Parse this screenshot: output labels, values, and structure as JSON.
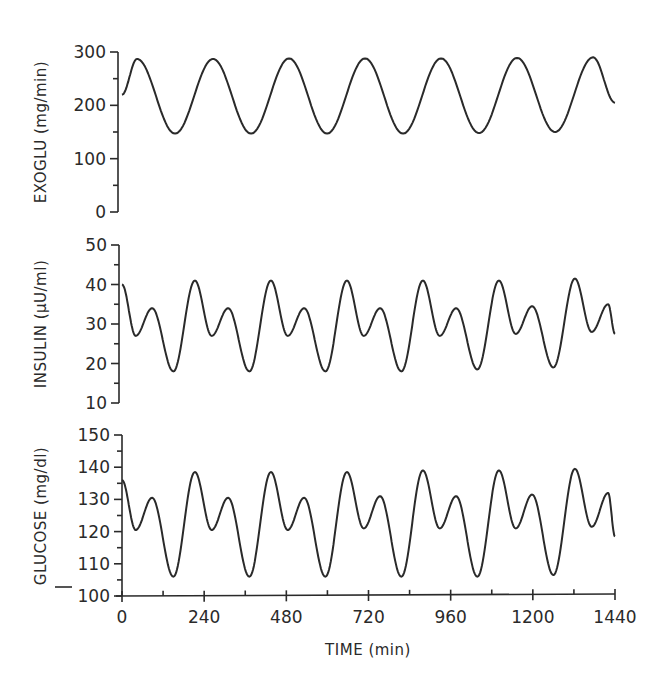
{
  "chart_data": [
    {
      "type": "line",
      "panel": "top",
      "ylabel": "EXOGLU (mg/min)",
      "xlabel": "",
      "ylim": [
        0,
        300
      ],
      "yticks": [
        0,
        100,
        200,
        300
      ],
      "yminor": [
        50,
        150,
        250
      ],
      "xlim": [
        0,
        1440
      ],
      "grid": false,
      "series": [
        {
          "name": "EXOGLU",
          "x": [
            0,
            44,
            155,
            266,
            377,
            488,
            599,
            710,
            821,
            932,
            1043,
            1154,
            1265,
            1376,
            1440
          ],
          "values": [
            220,
            287,
            147,
            287,
            147,
            288,
            147,
            288,
            147,
            288,
            148,
            289,
            150,
            290,
            205
          ]
        }
      ]
    },
    {
      "type": "line",
      "panel": "middle",
      "ylabel": "INSULIN (µU/ml)",
      "xlabel": "",
      "ylim": [
        10,
        50
      ],
      "yticks": [
        10,
        20,
        30,
        40,
        50
      ],
      "yminor": [
        15,
        25,
        35,
        45
      ],
      "xlim": [
        0,
        1440
      ],
      "grid": false,
      "series": [
        {
          "name": "INSULIN",
          "x": [
            0,
            40,
            88,
            150,
            213,
            262,
            310,
            372,
            435,
            484,
            532,
            594,
            657,
            706,
            754,
            816,
            879,
            928,
            976,
            1038,
            1101,
            1150,
            1198,
            1260,
            1323,
            1372,
            1420,
            1440
          ],
          "values": [
            40,
            27,
            34,
            18,
            41,
            27,
            34,
            18,
            41,
            27,
            34,
            18,
            41,
            27,
            34,
            18,
            41,
            27,
            34,
            18.5,
            41,
            27.5,
            34.5,
            19,
            41.5,
            28,
            35,
            27.5
          ]
        }
      ]
    },
    {
      "type": "line",
      "panel": "bottom",
      "ylabel": "GLUCOSE (mg/dl)",
      "xlabel": "TIME (min)",
      "ylim": [
        100,
        150
      ],
      "yticks": [
        100,
        110,
        120,
        130,
        140,
        150
      ],
      "yminor": [
        105,
        115,
        125,
        135,
        145
      ],
      "xlim": [
        0,
        1440
      ],
      "xticks": [
        0,
        240,
        480,
        720,
        960,
        1200,
        1440
      ],
      "xminor": [
        120,
        360,
        600,
        840,
        1080,
        1320
      ],
      "grid": false,
      "series": [
        {
          "name": "GLUCOSE",
          "x": [
            0,
            40,
            88,
            150,
            213,
            262,
            310,
            372,
            435,
            484,
            532,
            594,
            657,
            706,
            754,
            816,
            879,
            928,
            976,
            1038,
            1101,
            1150,
            1198,
            1260,
            1323,
            1372,
            1420,
            1440
          ],
          "values": [
            136,
            120.5,
            130.5,
            106,
            138.5,
            120.5,
            130.5,
            106,
            138.5,
            120.5,
            130.5,
            106,
            138.5,
            121,
            131,
            106,
            139,
            121,
            131,
            106,
            139,
            121,
            131.5,
            106.5,
            139.5,
            121.5,
            132,
            118.5
          ]
        }
      ]
    }
  ],
  "labels": {
    "top_ylabel": "EXOGLU  (mg/min)",
    "middle_ylabel": "INSULIN  (µU/ml)",
    "bottom_ylabel": "GLUCOSE  (mg/dl)",
    "xlabel": "TIME  (min)"
  },
  "colors": {
    "ink": "#2a2a2a",
    "background": "#ffffff"
  }
}
